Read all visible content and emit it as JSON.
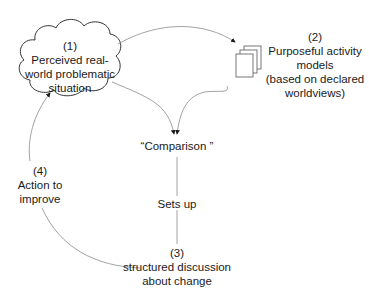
{
  "diagram": {
    "nodes": {
      "n1": {
        "number": "(1)",
        "lines": [
          "Perceived real-",
          "world problematic",
          "situation"
        ],
        "shape": "cloud"
      },
      "n2": {
        "number": "(2)",
        "lines": [
          "Purposeful activity",
          "models",
          "(based on declared",
          "worldviews)"
        ],
        "icon": "page-stack-icon"
      },
      "comparison": {
        "text": "“Comparison ”"
      },
      "sets_up": {
        "text": "Sets up"
      },
      "n3": {
        "number": "(3)",
        "lines": [
          "structured discussion",
          "about change"
        ]
      },
      "n4": {
        "number": "(4)",
        "lines": [
          "Action to",
          "improve"
        ]
      }
    },
    "edges": [
      {
        "from": "n1",
        "to": "n2",
        "arrow": true
      },
      {
        "from": "n1",
        "to": "comparison",
        "arrow": true
      },
      {
        "from": "n2",
        "to": "comparison",
        "arrow": true
      },
      {
        "from": "comparison",
        "to": "n3",
        "label": "Sets up",
        "arrow": false
      },
      {
        "from": "n3",
        "to": "n4",
        "arrow": false
      },
      {
        "from": "n4",
        "to": "n1",
        "arrow": true
      }
    ],
    "colors": {
      "line": "#8a8a8a",
      "text": "#1a1a1a",
      "arrowhead": "#1a1a1a",
      "background": "#ffffff"
    }
  }
}
